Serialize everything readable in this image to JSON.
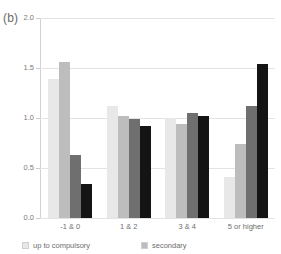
{
  "panel": {
    "label": "(b)"
  },
  "chart_data": {
    "type": "bar",
    "title": "",
    "xlabel": "",
    "ylabel": "",
    "ylim": [
      0.0,
      2.0
    ],
    "grid": true,
    "legend_position": "bottom",
    "ytick_labels": [
      "0.0",
      "0.5",
      "1.0",
      "1.5",
      "2.0"
    ],
    "ytick_values": [
      0.0,
      0.5,
      1.0,
      1.5,
      2.0
    ],
    "categories": [
      "-1 & 0",
      "1 & 2",
      "3 & 4",
      "5 or higher"
    ],
    "series": [
      {
        "name": "up to compulsory",
        "color": "#e8e8e8",
        "values": [
          1.39,
          1.12,
          1.0,
          0.41
        ]
      },
      {
        "name": "secondary",
        "color": "#bdbdbd",
        "values": [
          1.56,
          1.02,
          0.94,
          0.74
        ]
      },
      {
        "name": "",
        "color": "#6f6f6f",
        "values": [
          0.63,
          0.99,
          1.05,
          1.12
        ]
      },
      {
        "name": "",
        "color": "#141414",
        "values": [
          0.34,
          0.92,
          1.02,
          1.54
        ]
      }
    ],
    "legend": [
      {
        "label": "up to compulsory",
        "color": "#e8e8e8"
      },
      {
        "label": "secondary",
        "color": "#bdbdbd"
      }
    ]
  }
}
